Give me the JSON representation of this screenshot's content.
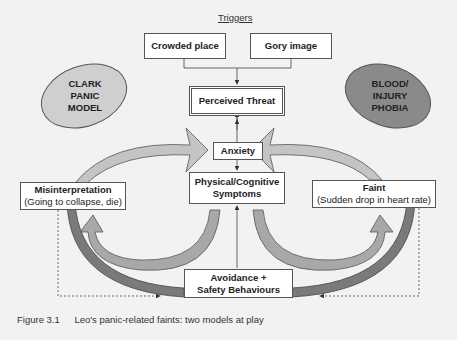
{
  "diagram": {
    "header": "Triggers",
    "triggers": [
      "Crowded place",
      "Gory image"
    ],
    "perceived_threat": "Perceived Threat",
    "anxiety": "Anxiety",
    "symptoms": [
      "Physical/Cognitive",
      "Symptoms"
    ],
    "avoidance": [
      "Avoidance +",
      "Safety Behaviours"
    ],
    "misinterpretation": {
      "title": "Misinterpretation",
      "detail": "(Going to collapse, die)"
    },
    "faint": {
      "title": "Faint",
      "detail": "(Sudden drop in heart rate)"
    },
    "models": {
      "left": [
        "CLARK",
        "PANIC",
        "MODEL"
      ],
      "right": [
        "BLOOD/",
        "INJURY",
        "PHOBIA"
      ]
    },
    "colors": {
      "left_ellipse": "#cfcfcf",
      "right_ellipse": "#8a8a8a",
      "light_arrow": "#c4c4c4",
      "dark_arrow": "#7a7a7a",
      "background": "#f2f2f2"
    }
  },
  "caption": {
    "number": "Figure 3.1",
    "text": "Leo's panic-related faints: two models at play"
  }
}
